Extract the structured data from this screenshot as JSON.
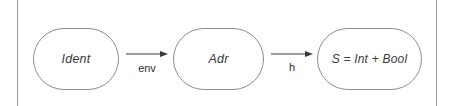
{
  "diagram": {
    "nodes": [
      {
        "id": "ident",
        "label": "Ident"
      },
      {
        "id": "adr",
        "label": "Adr"
      },
      {
        "id": "s",
        "label": "S = Int + Bool"
      }
    ],
    "edges": [
      {
        "id": "env",
        "label": "env",
        "from": "Ident",
        "to": "Adr"
      },
      {
        "id": "h",
        "label": "h",
        "from": "Adr",
        "to": "S = Int + Bool"
      }
    ],
    "colors": {
      "background": "#ffffff",
      "node_stroke": "#8d8d8d",
      "node_fill": "#ffffff",
      "node_text": "#3a3a3a",
      "edge_stroke": "#3a3a3a",
      "edge_text": "#2e2e2e",
      "rule_stroke": "#9a9a9a"
    }
  }
}
